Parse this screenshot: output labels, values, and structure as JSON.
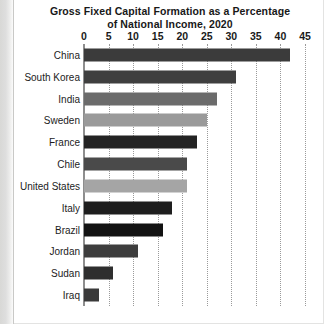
{
  "chart_data": {
    "type": "bar",
    "orientation": "horizontal",
    "title": "Gross Fixed Capital Formation as a Percentage of National Income, 2020",
    "title_lines": [
      "Gross Fixed Capital Formation as a Percentage",
      "of National Income, 2020"
    ],
    "xlabel": "",
    "ylabel": "",
    "xlim": [
      0,
      45
    ],
    "xticks": [
      0,
      5,
      10,
      15,
      20,
      25,
      30,
      35,
      40,
      45
    ],
    "xtick_labels": [
      "0",
      "5",
      "10",
      "15",
      "20",
      "25",
      "30",
      "35",
      "40",
      "45"
    ],
    "grid": "vertical-dotted",
    "legend": "none",
    "categories": [
      "China",
      "South Korea",
      "India",
      "Sweden",
      "France",
      "Chile",
      "United States",
      "Italy",
      "Brazil",
      "Jordan",
      "Sudan",
      "Iraq"
    ],
    "values": [
      42,
      31,
      27,
      25,
      23,
      21,
      21,
      18,
      16,
      11,
      6,
      3
    ],
    "bar_colors": [
      "#3b3b3b",
      "#3f3f3f",
      "#6b6b6b",
      "#9a9a9a",
      "#232323",
      "#4a4a4a",
      "#a5a5a5",
      "#1e1e1e",
      "#121212",
      "#3d3d3d",
      "#2e2e2e",
      "#3a3a3a"
    ]
  },
  "colors": {
    "background": "#ffffff",
    "text": "#1a1a1a",
    "axis": "#8e8e8e",
    "gridline": "#9a9a9a"
  }
}
